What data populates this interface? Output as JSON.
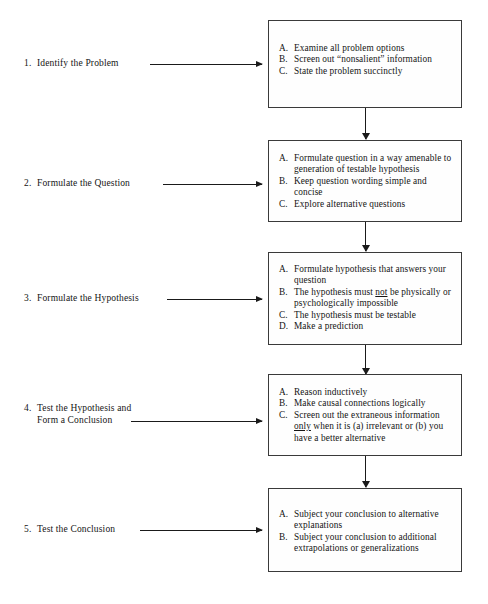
{
  "diagram": {
    "line_color": "#1a1a1a",
    "box_border_color": "#3a3a3a",
    "background_color": "#ffffff",
    "steps": [
      {
        "number": "1.",
        "label": "Identify the Problem",
        "label_line2": "",
        "items": [
          {
            "marker": "A.",
            "text": "Examine all problem options"
          },
          {
            "marker": "B.",
            "text": "Screen out “nonsalient” information"
          },
          {
            "marker": "C.",
            "text": "State the problem succinctly"
          }
        ]
      },
      {
        "number": "2.",
        "label": "Formulate the Question",
        "label_line2": "",
        "items": [
          {
            "marker": "A.",
            "text": "Formulate question in a way amenable to generation of testable hypothesis"
          },
          {
            "marker": "B.",
            "text": "Keep question wording simple and concise"
          },
          {
            "marker": "C.",
            "text": "Explore alternative questions"
          }
        ]
      },
      {
        "number": "3.",
        "label": "Formulate the Hypothesis",
        "label_line2": "",
        "items": [
          {
            "marker": "A.",
            "text": "Formulate hypothesis that answers your question"
          },
          {
            "marker": "B.",
            "text_pre": "The hypothesis must ",
            "text_underline": "not",
            "text_post": " be physically or psychologically impossible"
          },
          {
            "marker": "C.",
            "text": "The hypothesis must be testable"
          },
          {
            "marker": "D.",
            "text": "Make a prediction"
          }
        ]
      },
      {
        "number": "4.",
        "label": "Test the Hypothesis and",
        "label_line2": "Form a Conclusion",
        "items": [
          {
            "marker": "A.",
            "text": "Reason inductively"
          },
          {
            "marker": "B.",
            "text": "Make causal connections logically"
          },
          {
            "marker": "C.",
            "text_pre": "Screen out the extraneous information ",
            "text_underline": "only",
            "text_post": " when it is (a) irrelevant or (b) you have a better alternative"
          }
        ]
      },
      {
        "number": "5.",
        "label": "Test the Conclusion",
        "label_line2": "",
        "items": [
          {
            "marker": "A.",
            "text": "Subject your conclusion to alternative explanations"
          },
          {
            "marker": "B.",
            "text": "Subject your conclusion to additional extrapolations or generalizations"
          }
        ]
      }
    ]
  }
}
